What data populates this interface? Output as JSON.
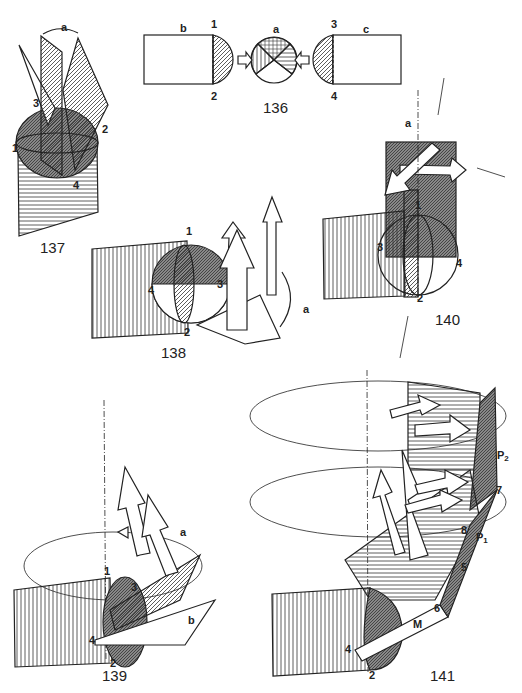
{
  "page": {
    "type": "technical illustration page",
    "background": "#ffffff",
    "ink": "#222222"
  },
  "figures": [
    {
      "id": "fig-136",
      "number": "136",
      "point_labels": [
        "1",
        "2",
        "3",
        "4"
      ],
      "letter_labels": [
        "a",
        "b",
        "c"
      ]
    },
    {
      "id": "fig-137",
      "number": "137",
      "point_labels": [
        "1",
        "2",
        "3",
        "4"
      ],
      "letter_labels": [
        "a"
      ]
    },
    {
      "id": "fig-138",
      "number": "138",
      "point_labels": [
        "1",
        "2",
        "3",
        "4"
      ],
      "letter_labels": [
        "a"
      ]
    },
    {
      "id": "fig-139",
      "number": "139",
      "point_labels": [
        "1",
        "2",
        "3",
        "4"
      ],
      "letter_labels": [
        "a",
        "b"
      ]
    },
    {
      "id": "fig-140",
      "number": "140",
      "point_labels": [
        "1",
        "2",
        "3",
        "4"
      ],
      "letter_labels": [
        "a"
      ]
    },
    {
      "id": "fig-141",
      "number": "141",
      "point_labels": [
        "2",
        "4",
        "5",
        "6",
        "7",
        "8"
      ],
      "letter_labels": [
        "M",
        "P",
        "1",
        "P",
        "2"
      ]
    }
  ],
  "labels": {
    "f136": {
      "num": "136",
      "b": "b",
      "c": "c",
      "a": "a",
      "p1": "1",
      "p2": "2",
      "p3": "3",
      "p4": "4"
    },
    "f137": {
      "num": "137",
      "a": "a",
      "p1": "1",
      "p2": "2",
      "p3": "3",
      "p4": "4"
    },
    "f138": {
      "num": "138",
      "a": "a",
      "p1": "1",
      "p2": "2",
      "p3": "3",
      "p4": "4"
    },
    "f139": {
      "num": "139",
      "a": "a",
      "b": "b",
      "p1": "1",
      "p2": "2",
      "p3": "3",
      "p4": "4"
    },
    "f140": {
      "num": "140",
      "a": "a",
      "p1": "1",
      "p2": "2",
      "p3": "3",
      "p4": "4"
    },
    "f141": {
      "num": "141",
      "M": "M",
      "P": "P",
      "P1sub": "1",
      "P2sub": "2",
      "p2": "2",
      "p4": "4",
      "p5": "5",
      "p6": "6",
      "p7": "7",
      "p8": "8"
    }
  }
}
